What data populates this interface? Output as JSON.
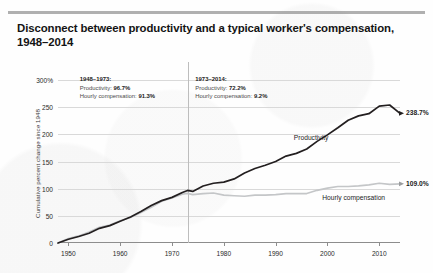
{
  "title": "Disconnect between productivity and a typical worker's compensation, 1948–2014",
  "annotations": [
    {
      "heading": "1948–1973:",
      "line1_label": "Productivity:",
      "line1_value": "96.7%",
      "line2_label": "Hourly compensation:",
      "line2_value": "91.3%"
    },
    {
      "heading": "1973–2014:",
      "line1_label": "Productivity:",
      "line1_value": "72.2%",
      "line2_label": "Hourly compensation:",
      "line2_value": "9.2%"
    }
  ],
  "series_labels": {
    "productivity": "Productivity",
    "compensation": "Hourly compensation"
  },
  "end_labels": {
    "productivity": "238.7%",
    "compensation": "109.0%"
  },
  "colors": {
    "productivity": "#231f20",
    "compensation": "#c4c6c8",
    "grid": "#d9d9d9",
    "axis": "#8d8d8d",
    "divider": "#bdbdbd",
    "text": "#1c1c1c"
  },
  "chart_data": {
    "type": "line",
    "title": "Disconnect between productivity and a typical worker's compensation, 1948–2014",
    "xlabel": "",
    "ylabel": "Cumulative percent change since 1948",
    "xlim": [
      1948,
      2014
    ],
    "ylim": [
      0,
      300
    ],
    "yticks": [
      0,
      50,
      100,
      150,
      200,
      250,
      300
    ],
    "ytick_labels": [
      "0",
      "50",
      "100",
      "150",
      "200",
      "250",
      "300%"
    ],
    "xticks": [
      1950,
      1960,
      1970,
      1980,
      1990,
      2000,
      2010
    ],
    "xtick_labels": [
      "1950",
      "1960",
      "1970",
      "1980",
      "1990",
      "2000",
      "2010"
    ],
    "grid": true,
    "legend": "inline-annotation",
    "vline": 1973,
    "series": [
      {
        "name": "Productivity",
        "end_value": 238.7,
        "x": [
          1948,
          1950,
          1952,
          1954,
          1956,
          1958,
          1960,
          1962,
          1964,
          1966,
          1968,
          1970,
          1972,
          1973,
          1974,
          1976,
          1978,
          1980,
          1982,
          1984,
          1986,
          1988,
          1990,
          1992,
          1994,
          1996,
          1998,
          2000,
          2002,
          2004,
          2006,
          2008,
          2010,
          2012,
          2014
        ],
        "values": [
          0,
          7,
          12,
          18,
          27,
          32,
          40,
          48,
          58,
          69,
          78,
          84,
          93,
          96.7,
          95,
          105,
          110,
          112,
          118,
          129,
          137,
          143,
          150,
          160,
          165,
          173,
          187,
          199,
          212,
          226,
          234,
          238,
          252,
          254,
          238.7
        ]
      },
      {
        "name": "Hourly compensation",
        "end_value": 109.0,
        "x": [
          1948,
          1950,
          1952,
          1954,
          1956,
          1958,
          1960,
          1962,
          1964,
          1966,
          1968,
          1970,
          1972,
          1973,
          1974,
          1976,
          1978,
          1980,
          1982,
          1984,
          1986,
          1988,
          1990,
          1992,
          1994,
          1996,
          1998,
          2000,
          2002,
          2004,
          2006,
          2008,
          2010,
          2012,
          2014
        ],
        "values": [
          0,
          8,
          13,
          20,
          29,
          33,
          41,
          47,
          56,
          66,
          77,
          83,
          90,
          91.3,
          89,
          91,
          92,
          88,
          87,
          86,
          88,
          88,
          89,
          91,
          91,
          91,
          97,
          101,
          104,
          104,
          105,
          107,
          110,
          108,
          109.0
        ]
      }
    ]
  }
}
